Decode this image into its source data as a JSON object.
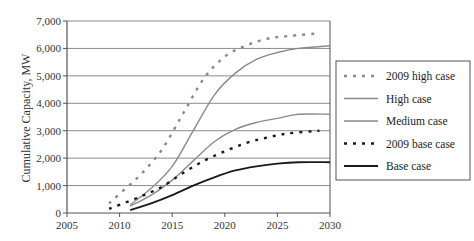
{
  "chart_data": {
    "type": "line",
    "title": "",
    "xlabel": "",
    "ylabel": "Cumulative Capacity, MW",
    "xlim": [
      2005,
      2030
    ],
    "ylim": [
      0,
      7000
    ],
    "x_ticks": [
      "2005",
      "2010",
      "2015",
      "2020",
      "2025",
      "2030"
    ],
    "y_ticks": [
      "0",
      "1,000",
      "2,000",
      "3,000",
      "4,000",
      "5,000",
      "6,000",
      "7,000"
    ],
    "grid": "horizontal",
    "legend_position": "right",
    "series": [
      {
        "name": "2009 high case",
        "style": "dotted",
        "color": "#8a8a8a",
        "x": [
          2009,
          2010,
          2012,
          2014,
          2016,
          2018,
          2020,
          2022,
          2024,
          2026,
          2029
        ],
        "values": [
          350,
          700,
          1400,
          2300,
          3600,
          4900,
          5700,
          6100,
          6350,
          6450,
          6550
        ]
      },
      {
        "name": "High case",
        "style": "solid",
        "color": "#8a8a8a",
        "x": [
          2011,
          2013,
          2015,
          2017,
          2019,
          2021,
          2023,
          2025,
          2027,
          2030
        ],
        "values": [
          300,
          900,
          1700,
          3000,
          4300,
          5100,
          5600,
          5850,
          6000,
          6100
        ]
      },
      {
        "name": "Medium case",
        "style": "solid",
        "color": "#8a8a8a",
        "x": [
          2011,
          2013,
          2015,
          2017,
          2019,
          2021,
          2023,
          2025,
          2027,
          2030
        ],
        "values": [
          250,
          650,
          1200,
          1900,
          2600,
          3050,
          3300,
          3450,
          3600,
          3600
        ]
      },
      {
        "name": "2009 base case",
        "style": "dotted",
        "color": "#1a1a1a",
        "x": [
          2009,
          2010,
          2012,
          2014,
          2016,
          2018,
          2020,
          2022,
          2024,
          2026,
          2029
        ],
        "values": [
          150,
          300,
          600,
          950,
          1450,
          1900,
          2250,
          2550,
          2750,
          2900,
          3000
        ]
      },
      {
        "name": "Base case",
        "style": "solid",
        "color": "#1a1a1a",
        "x": [
          2011,
          2013,
          2015,
          2017,
          2019,
          2021,
          2023,
          2025,
          2027,
          2030
        ],
        "values": [
          100,
          350,
          650,
          1000,
          1300,
          1550,
          1700,
          1800,
          1850,
          1850
        ]
      }
    ]
  }
}
